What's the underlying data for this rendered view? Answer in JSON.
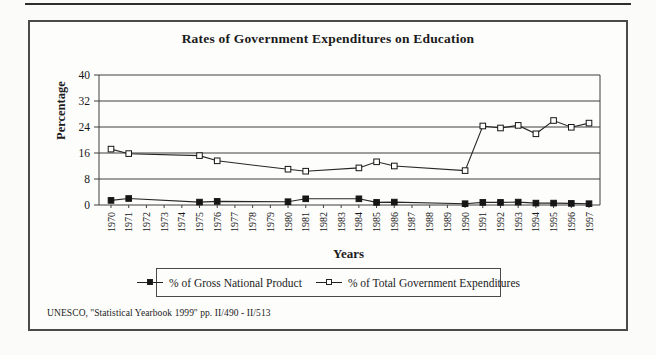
{
  "page": {
    "title": "Rates of Government Expenditures on Education",
    "source": "UNESCO, ''Statistical Yearbook 1999'' pp. II/490 - II/513"
  },
  "chart": {
    "title": "Rates of Government Expenditures on Education",
    "y_axis_label": "Percentage",
    "x_axis_label": "Years",
    "source": "UNESCO, ''Statistical Yearbook 1999'' pp. II/490 - II/513",
    "legend": [
      {
        "label": "% of Gross National Product",
        "marker": "filled-square"
      },
      {
        "label": "% of Total Government Expenditures",
        "marker": "open-square"
      }
    ]
  },
  "chart_data": {
    "type": "line",
    "title": "Rates of Government Expenditures on Education",
    "xlabel": "Years",
    "ylabel": "Percentage",
    "ylim": [
      0,
      40
    ],
    "yticks": [
      0,
      8,
      16,
      24,
      32,
      40
    ],
    "grid": true,
    "legend_position": "bottom",
    "line_color": "#262626",
    "categories": [
      "1970",
      "1971",
      "1972",
      "1973",
      "1974",
      "1975",
      "1976",
      "1977",
      "1978",
      "1979",
      "1980",
      "1981",
      "1982",
      "1983",
      "1984",
      "1985",
      "1986",
      "1987",
      "1988",
      "1989",
      "1990",
      "1991",
      "1992",
      "1993",
      "1994",
      "1995",
      "1996",
      "1997"
    ],
    "series": [
      {
        "name": "% of Gross National Product",
        "marker": "filled-square",
        "values": [
          1.4,
          2.0,
          null,
          null,
          null,
          0.9,
          1.1,
          null,
          null,
          null,
          1.0,
          1.9,
          null,
          null,
          1.9,
          0.8,
          0.9,
          null,
          null,
          null,
          0.4,
          0.8,
          0.8,
          0.9,
          0.6,
          0.6,
          0.5,
          0.4
        ]
      },
      {
        "name": "% of Total Government Expenditures",
        "marker": "open-square",
        "values": [
          17.2,
          15.8,
          null,
          null,
          null,
          15.2,
          13.6,
          null,
          null,
          null,
          11.0,
          10.4,
          null,
          null,
          11.4,
          13.3,
          12.0,
          null,
          null,
          null,
          10.6,
          24.3,
          23.7,
          24.5,
          21.9,
          26.0,
          23.9,
          25.2
        ]
      }
    ]
  }
}
